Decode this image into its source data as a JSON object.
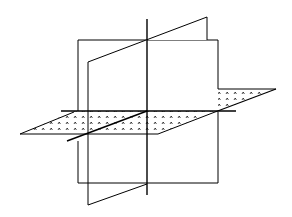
{
  "figure": {
    "stroke_color": "#000000",
    "background_color": "#ffffff",
    "fill_pattern": "dotted",
    "planes": [
      {
        "name": "back-vertical-plane",
        "type": "rectangle"
      },
      {
        "name": "slanted-vertical-plane",
        "type": "parallelogram"
      },
      {
        "name": "horizontal-plane",
        "type": "parallelogram",
        "pattern": "dotted"
      }
    ],
    "axes": [
      {
        "name": "vertical-intersection-line"
      },
      {
        "name": "horizontal-intersection-line"
      },
      {
        "name": "diagonal-intersection-line"
      }
    ]
  }
}
